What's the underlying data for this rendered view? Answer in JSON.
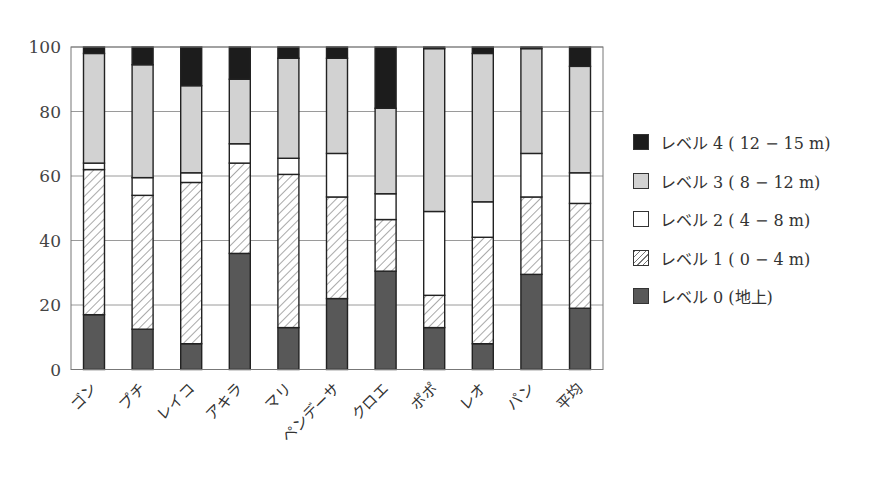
{
  "chart_data": {
    "type": "bar",
    "stacked": true,
    "title": "",
    "xlabel": "",
    "ylabel": "",
    "ylim": [
      0,
      100
    ],
    "yticks": [
      0,
      20,
      40,
      60,
      80,
      100
    ],
    "grid": true,
    "legend_position": "right",
    "categories": [
      "ゴン",
      "プチ",
      "レイコ",
      "アキラ",
      "マリ",
      "ペンデーサ",
      "クロエ",
      "ポポ",
      "レオ",
      "パン",
      "平均"
    ],
    "series": [
      {
        "name": "レベル 0（地上）",
        "key": "l0",
        "color": "#585858",
        "pattern": "solid",
        "values": [
          17,
          12.5,
          8,
          36,
          13,
          22,
          30.5,
          13,
          8,
          29.5,
          19
        ]
      },
      {
        "name": "レベル 1（0 − 4 m）",
        "key": "l1",
        "color": "#ffffff",
        "pattern": "hatch",
        "values": [
          45,
          41.5,
          50,
          28,
          47.5,
          31.5,
          16,
          10,
          33,
          24,
          32.5
        ]
      },
      {
        "name": "レベル 2（4 − 8 m）",
        "key": "l2",
        "color": "#ffffff",
        "pattern": "solid",
        "values": [
          2,
          5.5,
          3,
          6,
          5,
          13.5,
          8,
          26,
          11,
          13.5,
          9.5
        ]
      },
      {
        "name": "レベル 3（8 − 12 m）",
        "key": "l3",
        "color": "#d2d2d2",
        "pattern": "solid",
        "values": [
          34,
          35,
          27,
          20,
          31,
          29.5,
          26.5,
          50.5,
          46,
          32.5,
          33
        ]
      },
      {
        "name": "レベル 4（12 − 15 m）",
        "key": "l4",
        "color": "#1c1c1c",
        "pattern": "solid",
        "values": [
          2,
          5.5,
          12,
          10,
          3.5,
          3.5,
          19,
          0.5,
          2,
          0.5,
          6
        ]
      }
    ]
  },
  "legend": {
    "items": [
      {
        "key": "l4",
        "label": "レベル 4 ( 12 − 15 m)"
      },
      {
        "key": "l3",
        "label": "レベル 3 ( 8 − 12 m)"
      },
      {
        "key": "l2",
        "label": "レベル 2 ( 4 − 8 m)"
      },
      {
        "key": "l1",
        "label": "レベル 1 ( 0 − 4 m)"
      },
      {
        "key": "l0",
        "label": "レベル 0 (地上)"
      }
    ]
  }
}
